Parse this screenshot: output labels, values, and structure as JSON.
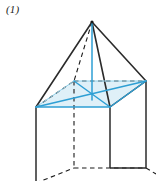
{
  "figure": {
    "label": "(1)",
    "caption": "",
    "type": "square-pyramid-on-square-prism",
    "projection": "oblique",
    "background_color": "#ffffff"
  },
  "colors": {
    "solid_edge": "#1a1a1a",
    "hidden_edge": "#1a1a1a",
    "accent_blue": "#2e9fd4",
    "accent_blue_dark": "#1b86bd",
    "base_fill": "#dff0f8",
    "label_text": "#1a1a1a"
  },
  "geometry": {
    "apex": {
      "name": "apex",
      "x": 92,
      "y": 22
    },
    "base_square": [
      {
        "name": "front-left",
        "x": 36,
        "y": 107,
        "hidden": false
      },
      {
        "name": "front-right",
        "x": 110,
        "y": 107,
        "hidden": false
      },
      {
        "name": "back-right",
        "x": 146,
        "y": 81,
        "hidden": false
      },
      {
        "name": "back-left",
        "x": 74,
        "y": 81,
        "hidden": true
      }
    ],
    "base_center": {
      "name": "base-center",
      "x": 92,
      "y": 94
    },
    "prism_bottom": [
      {
        "name": "bottom-front-left",
        "x": 36,
        "y": 183,
        "hidden": false
      },
      {
        "name": "bottom-front-right",
        "x": 110,
        "y": 168,
        "hidden": false
      },
      {
        "name": "bottom-back-right",
        "x": 146,
        "y": 168,
        "hidden": false
      },
      {
        "name": "bottom-back-left",
        "x": 74,
        "y": 168,
        "hidden": true
      }
    ]
  },
  "edges": {
    "pyramid_slant_solid": [
      "apex-to-front-left",
      "apex-to-front-right",
      "apex-to-back-right"
    ],
    "pyramid_slant_hidden": [
      "apex-to-back-left"
    ],
    "base_solid_black": [
      "front-right-to-back-right"
    ],
    "base_hidden_black": [
      "back-left-to-back-right",
      "front-left-to-back-left"
    ],
    "base_accent_blue": [
      "front-left-to-front-right",
      "front-right-to-back-right"
    ],
    "base_diagonals_blue": [
      "front-left-to-back-right",
      "front-right-to-back-left"
    ],
    "altitude_blue": "apex-to-base-center",
    "prism_vertical_solid": [
      "front-left-down",
      "front-right-down",
      "back-right-down"
    ],
    "prism_vertical_hidden": [
      "back-left-down"
    ],
    "prism_bottom_solid": [
      "bottom-front-right-to-bottom-back-right"
    ],
    "prism_bottom_hidden": [
      "bottom-front-left-to-bottom-back-left",
      "bottom-back-left-to-bottom-back-right"
    ]
  }
}
